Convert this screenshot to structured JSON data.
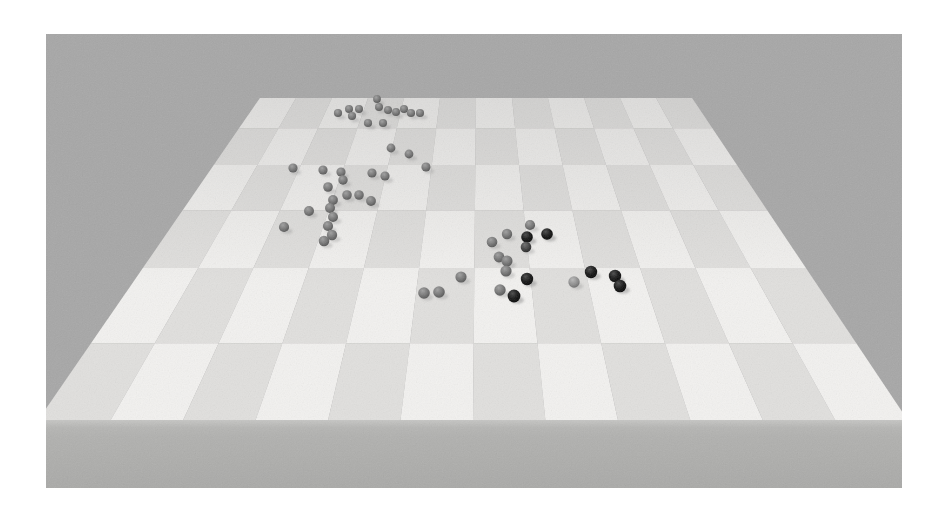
{
  "figure": {
    "kind": "3d-simulation-render",
    "page_background": "#ffffff",
    "scene": {
      "background": "#a7a7a7",
      "platform": {
        "checker_light": "#f3f2f0",
        "checker_dark": "#e1e0de",
        "side_face_top": "#c6c6c4",
        "side_face": "#b1b1af",
        "side_face_bottom": "#a9a9a7",
        "columns": 12,
        "visible_rows": 7,
        "haze_color": "#a7a7a7"
      },
      "sphere_palette": {
        "gray": "#757575",
        "light": "#8f8f8f",
        "dark": "#404040",
        "black": "#181818",
        "shadow": "#8c8c8c"
      },
      "sphere_counts": {
        "gray": 44,
        "light": 1,
        "dark": 1,
        "black": 7,
        "total": 53
      }
    },
    "spheres": [
      {
        "x": 292,
        "y": 79,
        "tone": "gray"
      },
      {
        "x": 303,
        "y": 75,
        "tone": "gray"
      },
      {
        "x": 306,
        "y": 82,
        "tone": "gray"
      },
      {
        "x": 313,
        "y": 75,
        "tone": "gray"
      },
      {
        "x": 331,
        "y": 65,
        "tone": "gray"
      },
      {
        "x": 333,
        "y": 73,
        "tone": "gray"
      },
      {
        "x": 342,
        "y": 76,
        "tone": "gray"
      },
      {
        "x": 350,
        "y": 78,
        "tone": "gray"
      },
      {
        "x": 358,
        "y": 75,
        "tone": "gray"
      },
      {
        "x": 365,
        "y": 79,
        "tone": "gray"
      },
      {
        "x": 374,
        "y": 79,
        "tone": "gray"
      },
      {
        "x": 322,
        "y": 89,
        "tone": "gray"
      },
      {
        "x": 337,
        "y": 89,
        "tone": "gray"
      },
      {
        "x": 345,
        "y": 114,
        "tone": "gray"
      },
      {
        "x": 363,
        "y": 120,
        "tone": "gray"
      },
      {
        "x": 380,
        "y": 133,
        "tone": "gray"
      },
      {
        "x": 247,
        "y": 134,
        "tone": "gray"
      },
      {
        "x": 277,
        "y": 136,
        "tone": "gray"
      },
      {
        "x": 295,
        "y": 138,
        "tone": "gray"
      },
      {
        "x": 326,
        "y": 139,
        "tone": "gray"
      },
      {
        "x": 339,
        "y": 142,
        "tone": "gray"
      },
      {
        "x": 297,
        "y": 146,
        "tone": "gray"
      },
      {
        "x": 282,
        "y": 153,
        "tone": "gray"
      },
      {
        "x": 301,
        "y": 161,
        "tone": "gray"
      },
      {
        "x": 313,
        "y": 161,
        "tone": "gray"
      },
      {
        "x": 287,
        "y": 166,
        "tone": "gray"
      },
      {
        "x": 325,
        "y": 167,
        "tone": "gray"
      },
      {
        "x": 284,
        "y": 174,
        "tone": "gray"
      },
      {
        "x": 263,
        "y": 177,
        "tone": "gray"
      },
      {
        "x": 287,
        "y": 183,
        "tone": "gray"
      },
      {
        "x": 238,
        "y": 193,
        "tone": "gray"
      },
      {
        "x": 282,
        "y": 192,
        "tone": "gray"
      },
      {
        "x": 286,
        "y": 201,
        "tone": "gray"
      },
      {
        "x": 278,
        "y": 207,
        "tone": "gray"
      },
      {
        "x": 484,
        "y": 191,
        "tone": "gray"
      },
      {
        "x": 461,
        "y": 200,
        "tone": "gray"
      },
      {
        "x": 501,
        "y": 200,
        "tone": "black"
      },
      {
        "x": 481,
        "y": 203,
        "tone": "black"
      },
      {
        "x": 446,
        "y": 208,
        "tone": "gray"
      },
      {
        "x": 480,
        "y": 213,
        "tone": "dark"
      },
      {
        "x": 453,
        "y": 223,
        "tone": "gray"
      },
      {
        "x": 461,
        "y": 227,
        "tone": "gray"
      },
      {
        "x": 460,
        "y": 237,
        "tone": "gray"
      },
      {
        "x": 545,
        "y": 238,
        "tone": "black"
      },
      {
        "x": 569,
        "y": 242,
        "tone": "black"
      },
      {
        "x": 415,
        "y": 243,
        "tone": "gray"
      },
      {
        "x": 481,
        "y": 245,
        "tone": "black"
      },
      {
        "x": 528,
        "y": 248,
        "tone": "light"
      },
      {
        "x": 574,
        "y": 252,
        "tone": "black"
      },
      {
        "x": 454,
        "y": 256,
        "tone": "gray"
      },
      {
        "x": 393,
        "y": 258,
        "tone": "gray"
      },
      {
        "x": 378,
        "y": 259,
        "tone": "gray"
      },
      {
        "x": 468,
        "y": 262,
        "tone": "black"
      }
    ]
  }
}
